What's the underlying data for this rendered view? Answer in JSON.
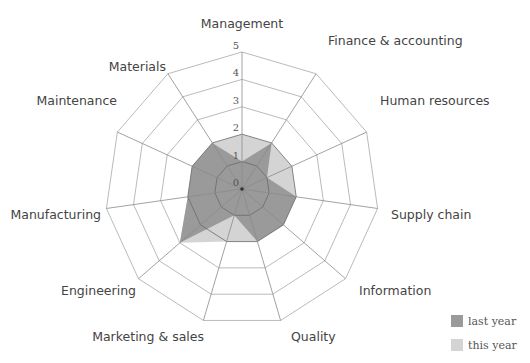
{
  "chart_data": {
    "type": "radar",
    "title": "",
    "categories": [
      "Management",
      "Finance & accounting",
      "Human resources",
      "Supply chain",
      "Information",
      "Quality",
      "Marketing & sales",
      "Engineering",
      "Manufacturing",
      "Maintenance",
      "Materials"
    ],
    "series": [
      {
        "name": "this year",
        "color": "#d4d4d4",
        "values": [
          2,
          2,
          2,
          2,
          2,
          2,
          2,
          3,
          2,
          2,
          2
        ]
      },
      {
        "name": "last year",
        "color": "#9a9a9a",
        "values": [
          1,
          2,
          1,
          2,
          2,
          2,
          1,
          3,
          2,
          2,
          2
        ]
      }
    ],
    "radial_ticks": [
      "0",
      "1",
      "2",
      "3",
      "4",
      "5"
    ],
    "rlim": [
      0,
      5
    ],
    "grid": true,
    "legend_position": "bottom-right"
  },
  "legend": {
    "items": [
      {
        "label": "last year",
        "color": "#9a9a9a"
      },
      {
        "label": "this year",
        "color": "#d4d4d4"
      }
    ]
  }
}
